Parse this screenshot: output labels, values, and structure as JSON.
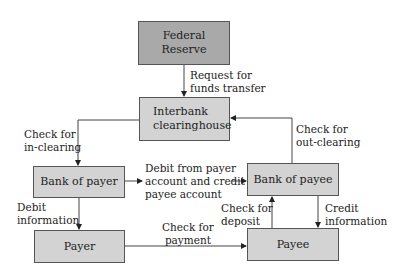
{
  "nodes": {
    "federal_reserve": "Federal Reserve",
    "interbank": "Interbank\nclearinghouse",
    "bank_of_payer": "Bank of payer",
    "bank_of_payee": "Bank of payee",
    "payer": "Payer",
    "payee": "Payee"
  },
  "edges": {
    "request_funds": "Request for\nfunds transfer",
    "in_clearing": "Check for\nin-clearing",
    "out_clearing": "Check for\nout-clearing",
    "debit_credit": "Debit from payer\naccount and credit\npayee account",
    "debit_info": "Debit\ninformation",
    "payment": "Check for\npayment",
    "deposit": "Check for\ndeposit",
    "credit_info": "Credit\ninformation"
  },
  "colors": {
    "federal_reserve_fill": "#a9a9a9",
    "box_fill": "#d3d3d3",
    "line": "#333333"
  }
}
